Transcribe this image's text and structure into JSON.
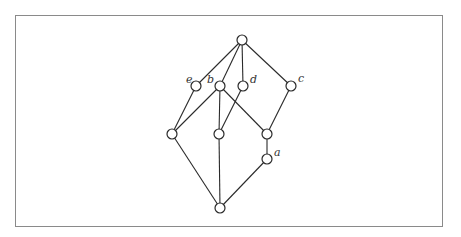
{
  "diagram": {
    "type": "hasse-diagram",
    "frame": {
      "x": 15,
      "y": 15,
      "width": 428,
      "height": 212,
      "color": "#8a8a8a"
    },
    "node_radius": 5,
    "nodes": [
      {
        "id": "top",
        "x": 242,
        "y": 40,
        "label": ""
      },
      {
        "id": "e",
        "x": 196,
        "y": 86,
        "label": "e",
        "lx": 186,
        "ly": 83
      },
      {
        "id": "b",
        "x": 220,
        "y": 86,
        "label": "b",
        "lx": 207,
        "ly": 83
      },
      {
        "id": "d",
        "x": 243,
        "y": 86,
        "label": "d",
        "lx": 250,
        "ly": 83
      },
      {
        "id": "c",
        "x": 291,
        "y": 86,
        "label": "c",
        "lx": 298,
        "ly": 82
      },
      {
        "id": "l",
        "x": 172,
        "y": 134,
        "label": ""
      },
      {
        "id": "m",
        "x": 219,
        "y": 134,
        "label": ""
      },
      {
        "id": "r",
        "x": 267,
        "y": 134,
        "label": ""
      },
      {
        "id": "a",
        "x": 267,
        "y": 159,
        "label": "a",
        "lx": 274,
        "ly": 156
      },
      {
        "id": "bot",
        "x": 220,
        "y": 208,
        "label": ""
      }
    ],
    "edges": [
      [
        "top",
        "e"
      ],
      [
        "top",
        "b"
      ],
      [
        "top",
        "d"
      ],
      [
        "top",
        "c"
      ],
      [
        "e",
        "l"
      ],
      [
        "b",
        "l"
      ],
      [
        "b",
        "m"
      ],
      [
        "b",
        "r"
      ],
      [
        "d",
        "m"
      ],
      [
        "c",
        "r"
      ],
      [
        "r",
        "a"
      ],
      [
        "l",
        "bot"
      ],
      [
        "m",
        "bot"
      ],
      [
        "a",
        "bot"
      ]
    ],
    "labels": {
      "e": "e",
      "b": "b",
      "d": "d",
      "c": "c",
      "a": "a"
    }
  }
}
